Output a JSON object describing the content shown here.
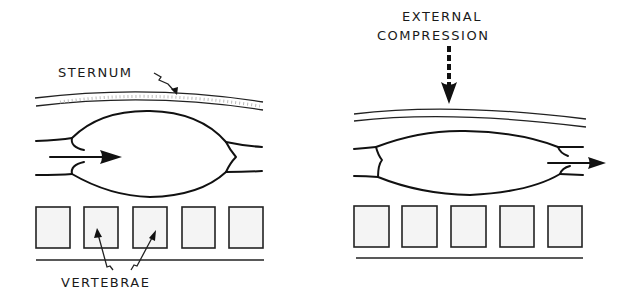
{
  "panels": [
    {
      "id": "left",
      "description": "Normal heart between sternum and vertebrae, blood flowing in",
      "labels": {
        "sternum": "STERNUM",
        "vertebrae": "VERTEBRAE"
      },
      "vertebra_count": 5,
      "flow_direction": "inflow"
    },
    {
      "id": "right",
      "description": "Heart compressed by external compression, blood flowing out",
      "labels": {
        "compression_line1": "EXTERNAL",
        "compression_line2": "COMPRESSION"
      },
      "vertebra_count": 5,
      "flow_direction": "outflow"
    }
  ],
  "colors": {
    "ink": "#111111",
    "background": "#ffffff"
  }
}
